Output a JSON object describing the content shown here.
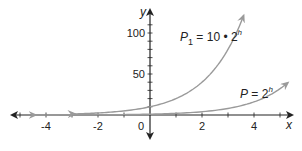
{
  "chart_data": {
    "type": "line",
    "title": "",
    "xlabel": "x",
    "ylabel": "y",
    "xlim": [
      -5.5,
      5.8
    ],
    "ylim": [
      -15,
      125
    ],
    "x_ticks": [
      -4,
      -2,
      0,
      2,
      4
    ],
    "x_tick_labels": [
      "-4",
      "-2",
      "0",
      "2",
      "4"
    ],
    "y_ticks": [
      50,
      100
    ],
    "y_tick_labels": [
      "50",
      "100"
    ],
    "grid": false,
    "legend": "inline labels",
    "series": [
      {
        "name": "P1 = 10 • 2^h",
        "label_main": "P",
        "label_sub": "1",
        "label_mid": " = 10 • 2",
        "label_sup": "h",
        "formula": "10*2^x",
        "x_range": [
          -2.9,
          3.6
        ],
        "color": "#9a9a9a",
        "x": [
          -2.9,
          -2,
          -1,
          0,
          1,
          2,
          3,
          3.5
        ],
        "y": [
          1.34,
          2.5,
          5,
          10,
          20,
          40,
          80,
          113.1
        ]
      },
      {
        "name": "P = 2^h",
        "label_main": "P",
        "label_mid": " = 2",
        "label_sup": "h",
        "formula": "2^x",
        "x_range": [
          -4.4,
          5.3
        ],
        "color": "#9a9a9a",
        "x": [
          -4.4,
          -2,
          0,
          2,
          4,
          5,
          5.3
        ],
        "y": [
          0.05,
          0.25,
          1,
          4,
          16,
          32,
          39.4
        ]
      }
    ]
  }
}
